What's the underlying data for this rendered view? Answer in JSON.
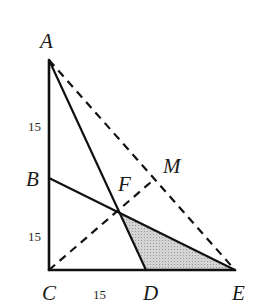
{
  "diagram": {
    "type": "geometry-figure",
    "points": {
      "A": {
        "label": "A",
        "x": 49,
        "y": 60,
        "lx": 40,
        "ly": 48
      },
      "B": {
        "label": "B",
        "x": 49,
        "y": 178,
        "lx": 26,
        "ly": 186
      },
      "C": {
        "label": "C",
        "x": 49,
        "y": 270,
        "lx": 43,
        "ly": 300
      },
      "D": {
        "label": "D",
        "x": 146,
        "y": 270,
        "lx": 144,
        "ly": 300
      },
      "E": {
        "label": "E",
        "x": 235,
        "y": 270,
        "lx": 233,
        "ly": 300
      },
      "F": {
        "label": "F",
        "x": 118,
        "y": 211,
        "lx": 118,
        "ly": 190
      },
      "M": {
        "label": "M",
        "x": 151,
        "y": 182,
        "lx": 163,
        "ly": 172
      }
    },
    "lengths": [
      {
        "text": "15",
        "segment": "AB",
        "x": 28,
        "y": 130
      },
      {
        "text": "15",
        "segment": "BC",
        "x": 28,
        "y": 240
      },
      {
        "text": "15",
        "segment": "CD",
        "x": 93,
        "y": 298
      }
    ],
    "solid_segments": [
      "AC",
      "CE",
      "AD",
      "BE"
    ],
    "dashed_segments": [
      "AE",
      "CM"
    ],
    "shaded_region": {
      "vertices": [
        "F",
        "D",
        "E"
      ],
      "fill": "#c8c8c8"
    },
    "colors": {
      "stroke": "#111111",
      "shade": "#c8c8c8",
      "background": "#ffffff"
    }
  }
}
